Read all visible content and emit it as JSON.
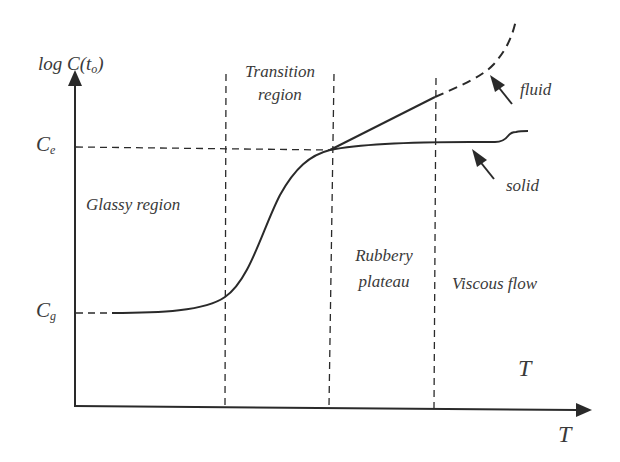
{
  "diagram": {
    "y_axis_label": {
      "prefix": "log C(t",
      "sub": "o",
      "suffix": ")"
    },
    "x_axis_label": "T",
    "inner_T_label": "T",
    "level_labels": {
      "ce": {
        "main": "C",
        "sub": "e"
      },
      "cg": {
        "main": "C",
        "sub": "g"
      }
    },
    "regions": [
      {
        "id": "glassy",
        "label": "Glassy region"
      },
      {
        "id": "transition",
        "line1": "Transition",
        "line2": "region"
      },
      {
        "id": "rubbery",
        "line1": "Rubbery",
        "line2": "plateau"
      },
      {
        "id": "viscous",
        "label": "Viscous flow"
      }
    ],
    "curve_labels": {
      "fluid": "fluid",
      "solid": "solid"
    },
    "colors": {
      "line": "#2a2a2a",
      "text": "#3a3a3a",
      "background": "#ffffff"
    }
  }
}
